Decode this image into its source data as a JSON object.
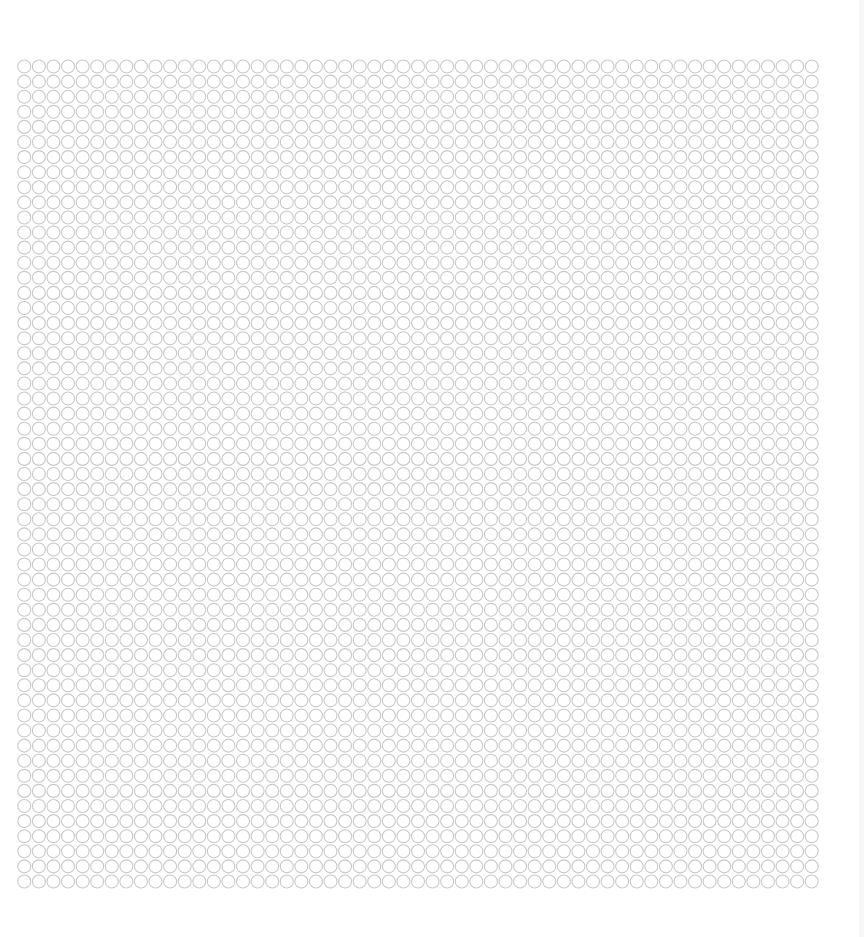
{
  "pattern": {
    "name": "circle-grid",
    "shape": "circle",
    "columns": 55,
    "rows": 55,
    "stroke_color": "#c9c9c9",
    "fill_color": "#ffffff"
  },
  "background_color": "#ffffff"
}
